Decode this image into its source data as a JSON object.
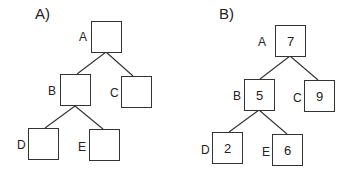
{
  "panels": [
    {
      "label": "A)",
      "nodes": {
        "A": {
          "label": "A",
          "value": ""
        },
        "B": {
          "label": "B",
          "value": ""
        },
        "C": {
          "label": "C",
          "value": ""
        },
        "D": {
          "label": "D",
          "value": ""
        },
        "E": {
          "label": "E",
          "value": ""
        }
      }
    },
    {
      "label": "B)",
      "nodes": {
        "A": {
          "label": "A",
          "value": "7"
        },
        "B": {
          "label": "B",
          "value": "5"
        },
        "C": {
          "label": "C",
          "value": "9"
        },
        "D": {
          "label": "D",
          "value": "2"
        },
        "E": {
          "label": "E",
          "value": "6"
        }
      }
    }
  ],
  "edges": [
    [
      "A",
      "B"
    ],
    [
      "A",
      "C"
    ],
    [
      "B",
      "D"
    ],
    [
      "B",
      "E"
    ]
  ]
}
